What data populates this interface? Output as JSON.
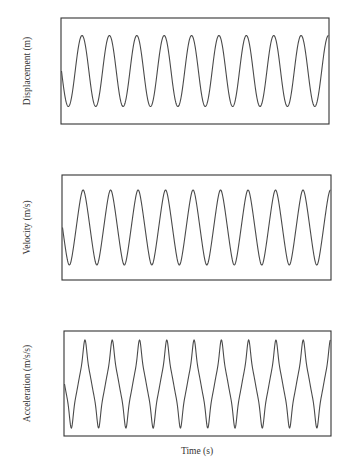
{
  "figure": {
    "xlabel": "Time (s)"
  },
  "chart_data": [
    {
      "type": "line",
      "title": "",
      "xlabel": "",
      "ylabel": "Displacement (m)",
      "grid": false,
      "ticks": "none",
      "waveform": "sinusoid",
      "cycles_shown": 9.75,
      "start_phase": "zero, descending",
      "series": [
        {
          "name": "displacement",
          "shape": "sine",
          "amplitude_rel": 1.0
        }
      ],
      "box": {
        "x": 61,
        "y": 18,
        "w": 268,
        "h": 106
      },
      "trace": {
        "mid": 71,
        "amp": 35.5
      }
    },
    {
      "type": "line",
      "title": "",
      "xlabel": "",
      "ylabel": "Velocity (m/s)",
      "grid": false,
      "ticks": "none",
      "waveform": "near-triangular periodic",
      "cycles_shown": 9.75,
      "start_phase": "zero, descending",
      "series": [
        {
          "name": "velocity",
          "shape": "triangle-like",
          "amplitude_rel": 1.0
        }
      ],
      "box": {
        "x": 62,
        "y": 175,
        "w": 269,
        "h": 105
      },
      "trace": {
        "mid": 227.5,
        "amp": 37.5
      }
    },
    {
      "type": "line",
      "title": "",
      "xlabel": "Time (s)",
      "ylabel": "Acceleration (m/s/s)",
      "grid": false,
      "ticks": "none",
      "waveform": "peaked periodic with shoulders at zero-crossings",
      "cycles_shown": 9.75,
      "start_phase": "zero, descending",
      "series": [
        {
          "name": "acceleration",
          "shape": "spiky",
          "amplitude_rel": 1.0
        }
      ],
      "box": {
        "x": 64,
        "y": 331,
        "w": 267,
        "h": 105
      },
      "trace": {
        "mid": 384,
        "amp": 44
      }
    }
  ]
}
